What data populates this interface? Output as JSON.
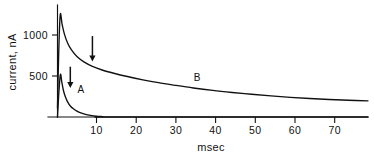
{
  "chart_data": {
    "type": "line",
    "title": "",
    "xlabel": "msec",
    "ylabel": "current, nA",
    "xlim": [
      0,
      80
    ],
    "ylim": [
      0,
      1370
    ],
    "grid": false,
    "legend": "none",
    "x_ticks": [
      {
        "value": 10,
        "label": "10"
      },
      {
        "value": 20,
        "label": "20"
      },
      {
        "value": 30,
        "label": "30"
      },
      {
        "value": 40,
        "label": "40"
      },
      {
        "value": 50,
        "label": "50"
      },
      {
        "value": 60,
        "label": "60"
      },
      {
        "value": 70,
        "label": "70"
      }
    ],
    "y_ticks": [
      {
        "value": 500,
        "label": "500"
      },
      {
        "value": 1000,
        "label": "1000"
      }
    ],
    "series": [
      {
        "name": "A",
        "label": "A",
        "label_x": 6.0,
        "label_y": 300,
        "points": [
          [
            0.0,
            0
          ],
          [
            0.35,
            300
          ],
          [
            0.75,
            520
          ],
          [
            1.1,
            430
          ],
          [
            1.5,
            330
          ],
          [
            2.0,
            250
          ],
          [
            2.6,
            185
          ],
          [
            3.3,
            135
          ],
          [
            4.1,
            100
          ],
          [
            5.0,
            72
          ],
          [
            6.0,
            50
          ],
          [
            7.2,
            32
          ],
          [
            8.5,
            20
          ],
          [
            10.0,
            10
          ],
          [
            11.5,
            5
          ],
          [
            13.0,
            2
          ],
          [
            15.0,
            0
          ],
          [
            80.0,
            0
          ]
        ]
      },
      {
        "name": "B",
        "label": "B",
        "label_x": 36.0,
        "label_y": 440,
        "points": [
          [
            0.0,
            110
          ],
          [
            0.3,
            760
          ],
          [
            0.7,
            1250
          ],
          [
            1.2,
            1130
          ],
          [
            1.8,
            1010
          ],
          [
            2.6,
            905
          ],
          [
            3.6,
            820
          ],
          [
            5.0,
            740
          ],
          [
            6.8,
            675
          ],
          [
            9.0,
            620
          ],
          [
            11.5,
            575
          ],
          [
            14.5,
            535
          ],
          [
            18.0,
            495
          ],
          [
            22.0,
            455
          ],
          [
            26.0,
            420
          ],
          [
            30.0,
            390
          ],
          [
            35.0,
            355
          ],
          [
            40.0,
            325
          ],
          [
            45.0,
            300
          ],
          [
            50.0,
            278
          ],
          [
            55.0,
            258
          ],
          [
            60.0,
            240
          ],
          [
            65.0,
            226
          ],
          [
            70.0,
            214
          ],
          [
            75.0,
            205
          ],
          [
            80.0,
            198
          ]
        ]
      }
    ],
    "annotations": [
      {
        "name": "arrow-curve-b",
        "type": "down-arrow",
        "x": 9.0,
        "y_top": 990,
        "y_tip": 680
      },
      {
        "name": "arrow-curve-a",
        "type": "down-arrow",
        "x": 3.3,
        "y_top": 615,
        "y_tip": 355
      }
    ]
  }
}
